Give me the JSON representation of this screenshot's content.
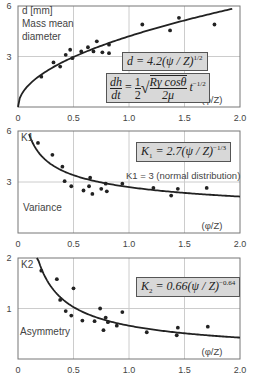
{
  "chart_data": [
    {
      "type": "scatter",
      "title": "",
      "ylabel_lines": [
        "d [mm]",
        "Mass mean",
        "diameter"
      ],
      "xlabel": "(φ/Z)",
      "xticks": [
        "0",
        "0.5",
        "1.0",
        "1.5",
        "2.0"
      ],
      "yticks": [
        "6",
        "3"
      ],
      "xlim": [
        0,
        2.0
      ],
      "ylim": [
        0,
        6
      ],
      "grid": true,
      "equation": "d = 4.2(ψ/Z)^1/2",
      "equation2": "dh/dt = 1/2 √(Rγcosθ / 2μ) t^-1/2",
      "fit_curve": {
        "formula": "4.2*x^0.5",
        "x_range": [
          0,
          1.93
        ]
      },
      "points": [
        [
          0.21,
          1.8
        ],
        [
          0.32,
          2.65
        ],
        [
          0.38,
          2.4
        ],
        [
          0.43,
          3.1
        ],
        [
          0.47,
          3.4
        ],
        [
          0.49,
          2.9
        ],
        [
          0.57,
          3.3
        ],
        [
          0.63,
          3.55
        ],
        [
          0.68,
          3.3
        ],
        [
          0.71,
          3.9
        ],
        [
          0.76,
          3.25
        ],
        [
          0.82,
          3.2
        ],
        [
          0.82,
          3.7
        ],
        [
          1.12,
          4.9
        ],
        [
          1.37,
          4.55
        ],
        [
          1.45,
          5.3
        ],
        [
          1.77,
          4.9
        ]
      ]
    },
    {
      "type": "scatter",
      "title": "",
      "ylabel": "K1",
      "side_label": "Variance",
      "annotation": "K1 = 3 (normal distribution)",
      "xlabel": "(φ/Z)",
      "xticks": [
        "0",
        "0.5",
        "1.0",
        "1.5",
        "2.0"
      ],
      "yticks": [
        "6",
        "3"
      ],
      "xlim": [
        0,
        2.0
      ],
      "ylim": [
        0,
        6
      ],
      "grid": true,
      "equation": "K1 = 2.7(ψ/Z)^-1/3",
      "fit_curve": {
        "formula": "2.7*x^(-1/3)",
        "x_range": [
          0.1,
          2.0
        ]
      },
      "points": [
        [
          0.18,
          5.3
        ],
        [
          0.31,
          4.6
        ],
        [
          0.4,
          3.9
        ],
        [
          0.42,
          3.05
        ],
        [
          0.48,
          2.75
        ],
        [
          0.59,
          2.5
        ],
        [
          0.64,
          2.75
        ],
        [
          0.65,
          3.25
        ],
        [
          0.67,
          2.3
        ],
        [
          0.75,
          2.6
        ],
        [
          0.79,
          2.9
        ],
        [
          0.8,
          2.45
        ],
        [
          0.94,
          2.9
        ],
        [
          1.22,
          2.65
        ],
        [
          1.38,
          2.2
        ],
        [
          1.44,
          2.6
        ],
        [
          1.7,
          2.65
        ]
      ]
    },
    {
      "type": "scatter",
      "title": "",
      "ylabel": "K2",
      "side_label": "Asymmetry",
      "xlabel": "(φ/Z)",
      "xticks": [
        "0",
        "0.5",
        "1.0",
        "1.5",
        "2.0"
      ],
      "yticks": [
        "2",
        "1"
      ],
      "xlim": [
        0,
        2.0
      ],
      "ylim": [
        0,
        2
      ],
      "grid": true,
      "equation": "K2 = 0.66(ψ/Z)^-0.64",
      "fit_curve": {
        "formula": "0.66*x^(-0.64)",
        "x_range": [
          0.17,
          2.0
        ]
      },
      "points": [
        [
          0.21,
          1.75
        ],
        [
          0.35,
          1.58
        ],
        [
          0.38,
          1.17
        ],
        [
          0.43,
          0.95
        ],
        [
          0.48,
          0.86
        ],
        [
          0.5,
          1.4
        ],
        [
          0.58,
          0.76
        ],
        [
          0.69,
          0.75
        ],
        [
          0.74,
          1.0
        ],
        [
          0.77,
          0.57
        ],
        [
          0.79,
          0.82
        ],
        [
          0.81,
          0.73
        ],
        [
          0.89,
          0.66
        ],
        [
          0.94,
          0.93
        ],
        [
          1.16,
          0.53
        ],
        [
          1.43,
          0.47
        ],
        [
          1.44,
          0.62
        ],
        [
          1.71,
          0.64
        ]
      ]
    }
  ],
  "labels": {
    "c1_y1": "d [mm]",
    "c1_y2": "Mass mean",
    "c1_y3": "diameter",
    "c2_k": "K1",
    "c2_side": "Variance",
    "c2_note": "K1 = 3 (normal distribution)",
    "c3_k": "K2",
    "c3_side": "Asymmetry",
    "xlabel": "(φ/Z)",
    "eq1_lhs": "d",
    "eq1_rhs": "= 4.2(ψ / Z)",
    "eq1_exp": "1/2",
    "eq2_dh": "dh",
    "eq2_dt": "dt",
    "eq2_eq": "=",
    "eq2_one": "1",
    "eq2_two": "2",
    "eq2_num": "Rγ cosθ",
    "eq2_den": "2μ",
    "eq2_t": "t",
    "eq2_exp": "−1/2",
    "eq3_k": "K",
    "eq3_sub": "1",
    "eq3_rhs": "= 2.7(ψ / Z)",
    "eq3_exp": "−1/3",
    "eq4_k": "K",
    "eq4_sub": "2",
    "eq4_rhs": "= 0.66(ψ / Z)",
    "eq4_exp": "−0.64"
  },
  "colors": {
    "frame": "#777777",
    "grid": "#cccccc",
    "curve": "#222222",
    "point": "#222222",
    "box_fill": "#d8d8d8"
  }
}
